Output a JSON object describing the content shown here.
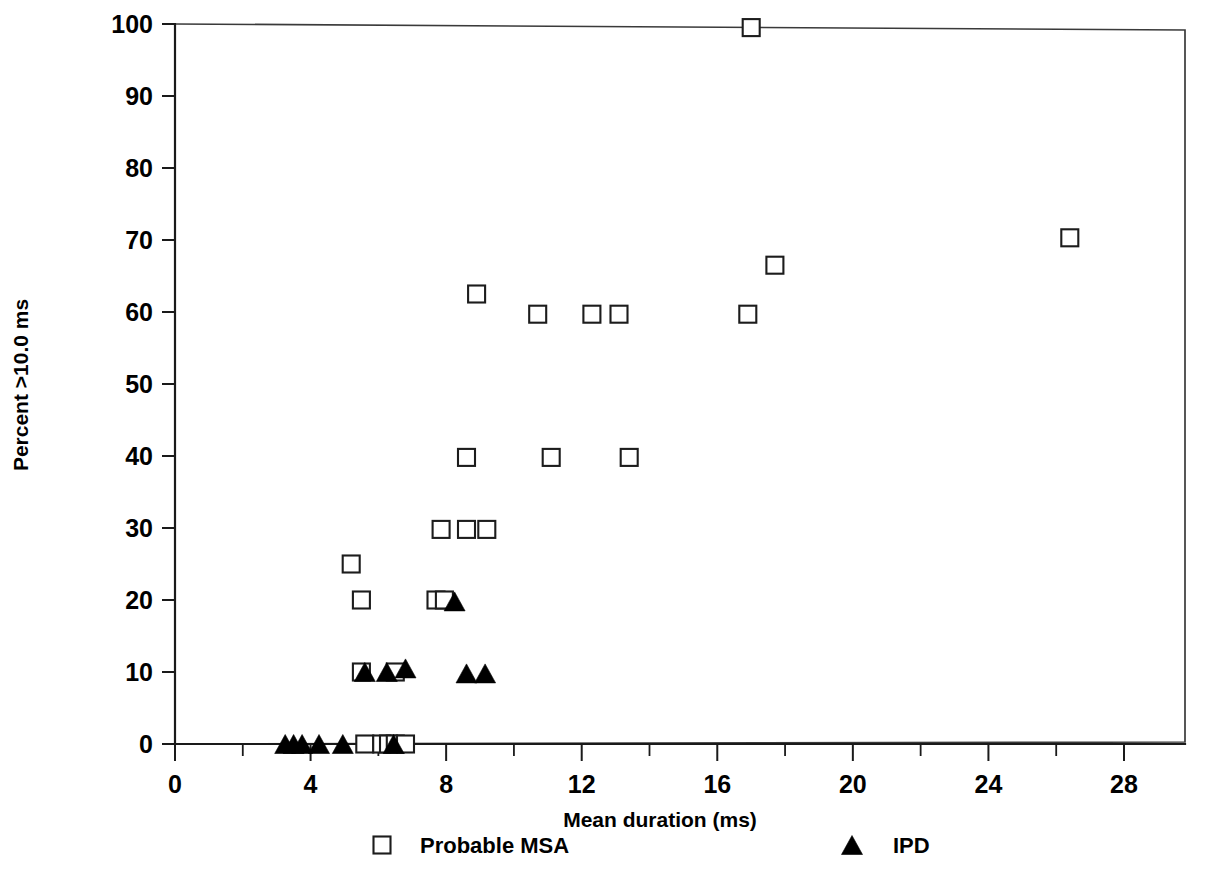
{
  "chart_data": {
    "type": "scatter",
    "title": "",
    "xlabel": "Mean duration (ms)",
    "ylabel": "Percent >10.0 ms",
    "xlim": [
      0,
      29.8
    ],
    "ylim": [
      0,
      100
    ],
    "xticks": [
      0,
      4,
      8,
      12,
      16,
      20,
      24,
      28
    ],
    "xtick_labels": [
      "0",
      "4",
      "8",
      "12",
      "16",
      "20",
      "24",
      "28"
    ],
    "xticks_minor": [
      2,
      6,
      10,
      14,
      18,
      22,
      26
    ],
    "yticks": [
      0,
      10,
      20,
      30,
      40,
      50,
      60,
      70,
      80,
      90,
      100
    ],
    "ytick_labels": [
      "0",
      "10",
      "20",
      "30",
      "40",
      "50",
      "60",
      "70",
      "80",
      "90",
      "100"
    ],
    "grid": false,
    "legend_position": "below-axis",
    "frame": "box",
    "series": [
      {
        "name": "Probable MSA",
        "marker": "open-square",
        "color": "#ffffff",
        "edge_color": "#1c1c1c",
        "points": [
          {
            "x": 5.6,
            "y": 0.0
          },
          {
            "x": 6.1,
            "y": 0.0
          },
          {
            "x": 6.3,
            "y": 0.0
          },
          {
            "x": 6.5,
            "y": 0.0
          },
          {
            "x": 6.8,
            "y": 0.0
          },
          {
            "x": 5.5,
            "y": 10.0
          },
          {
            "x": 6.5,
            "y": 10.0
          },
          {
            "x": 5.5,
            "y": 20.0
          },
          {
            "x": 7.7,
            "y": 20.0
          },
          {
            "x": 7.95,
            "y": 20.0
          },
          {
            "x": 5.2,
            "y": 25.0
          },
          {
            "x": 7.85,
            "y": 29.8
          },
          {
            "x": 8.6,
            "y": 29.8
          },
          {
            "x": 9.2,
            "y": 29.8
          },
          {
            "x": 8.6,
            "y": 39.8
          },
          {
            "x": 11.1,
            "y": 39.8
          },
          {
            "x": 13.4,
            "y": 39.8
          },
          {
            "x": 10.7,
            "y": 59.7
          },
          {
            "x": 12.3,
            "y": 59.7
          },
          {
            "x": 13.1,
            "y": 59.7
          },
          {
            "x": 16.9,
            "y": 59.7
          },
          {
            "x": 8.9,
            "y": 62.5
          },
          {
            "x": 17.7,
            "y": 66.5
          },
          {
            "x": 26.4,
            "y": 70.3
          },
          {
            "x": 17.0,
            "y": 99.5
          }
        ]
      },
      {
        "name": "IPD",
        "marker": "filled-triangle",
        "color": "#000000",
        "edge_color": "#000000",
        "points": [
          {
            "x": 3.25,
            "y": 0.0
          },
          {
            "x": 3.5,
            "y": 0.0
          },
          {
            "x": 3.75,
            "y": 0.0
          },
          {
            "x": 4.25,
            "y": 0.0
          },
          {
            "x": 4.95,
            "y": 0.0
          },
          {
            "x": 6.45,
            "y": 0.0
          },
          {
            "x": 5.6,
            "y": 10.0
          },
          {
            "x": 6.25,
            "y": 10.0
          },
          {
            "x": 6.8,
            "y": 10.5
          },
          {
            "x": 8.6,
            "y": 9.8
          },
          {
            "x": 9.15,
            "y": 9.8
          },
          {
            "x": 8.25,
            "y": 19.8
          }
        ]
      }
    ]
  },
  "legend": {
    "items": [
      {
        "label": "Probable MSA",
        "marker": "open-square"
      },
      {
        "label": "IPD",
        "marker": "filled-triangle"
      }
    ]
  }
}
